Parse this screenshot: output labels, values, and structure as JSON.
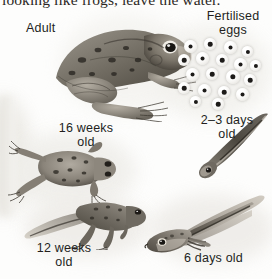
{
  "page": {
    "body_text_line": "looking like frogs, leave the water.",
    "background_color": "#fdfdfc",
    "ink_color": "#231f1d",
    "illustration_style": "grayscale pencil and wash natural history illustration"
  },
  "diagram": {
    "stages": [
      {
        "id": "adult",
        "label": "Adult",
        "label_lines": [
          "Adult"
        ],
        "illustration": "adult-frog",
        "position": "top-left"
      },
      {
        "id": "fertilised-eggs",
        "label": "Fertilised eggs",
        "label_lines": [
          "Fertilised",
          "eggs"
        ],
        "illustration": "frog-spawn-egg-cluster",
        "egg_count": 19,
        "position": "top-right"
      },
      {
        "id": "2-3-days",
        "label": "2–3 days old",
        "label_lines": [
          "2–3 days",
          "old"
        ],
        "illustration": "embryo-tadpole",
        "position": "middle-right"
      },
      {
        "id": "6-days",
        "label": "6 days old",
        "label_lines": [
          "6 days old"
        ],
        "illustration": "tadpole-with-external-gills",
        "position": "bottom-right"
      },
      {
        "id": "12-weeks",
        "label": "12 weeks old",
        "label_lines": [
          "12 weeks",
          "old"
        ],
        "illustration": "tadpole-with-legs-and-tail",
        "position": "bottom-left"
      },
      {
        "id": "16-weeks",
        "label": "16 weeks old",
        "label_lines": [
          "16 weeks",
          "old"
        ],
        "illustration": "young-froglet",
        "position": "middle-left"
      }
    ]
  }
}
